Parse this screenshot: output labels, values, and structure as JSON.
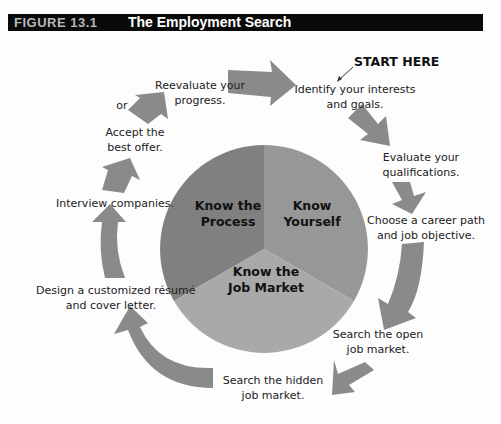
{
  "figure": {
    "number": "FIGURE 13.1",
    "title": "The Employment Search"
  },
  "start_label": "START HERE",
  "steps": [
    {
      "line1": "Identify your interests",
      "line2": "and goals."
    },
    {
      "line1": "Evaluate your",
      "line2": "qualifications."
    },
    {
      "line1": "Choose a career path",
      "line2": "and job objective."
    },
    {
      "line1": "Search the open",
      "line2": "job market."
    },
    {
      "line1": "Search the hidden",
      "line2": "job market."
    },
    {
      "line1": "Design a customized résumé",
      "line2": "and cover letter."
    },
    {
      "line1": "Interview companies.",
      "line2": ""
    },
    {
      "line1": "Accept the",
      "line2": "best offer."
    },
    {
      "line1": "or",
      "line2": ""
    },
    {
      "line1": "Reevaluate your",
      "line2": "progress."
    }
  ],
  "center_pie": {
    "segments": [
      {
        "line1": "Know the",
        "line2": "Process",
        "share": 0.333,
        "color": "#808080"
      },
      {
        "line1": "Know",
        "line2": "Yourself",
        "share": 0.333,
        "color": "#979797"
      },
      {
        "line1": "Know the",
        "line2": "Job Market",
        "share": 0.333,
        "color": "#a9a9a9"
      }
    ]
  },
  "colors": {
    "arrow": "#8a8a8a",
    "arrow_shade": "#a3a3a3",
    "header_bg": "#0a0a0a"
  }
}
